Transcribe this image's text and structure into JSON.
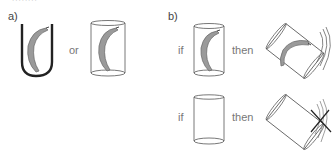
{
  "header_fragment": "........",
  "panel_a": {
    "label": "a)",
    "connector": "or",
    "items": [
      {
        "name": "banana-in-u-tube",
        "description": "banana held in open U-shaped holder"
      },
      {
        "name": "banana-in-closed-cylinder",
        "description": "banana enclosed in cylinder"
      }
    ]
  },
  "panel_b": {
    "label": "b)",
    "rows": [
      {
        "if_label": "if",
        "then_label": "then",
        "condition": "cylinder containing banana",
        "result": "tilted cylinder with banana, motion lines"
      },
      {
        "if_label": "if",
        "then_label": "then",
        "condition": "empty cylinder",
        "result": "tilted empty cylinder, motion lines crossed out"
      }
    ]
  },
  "colors": {
    "outline": "#555555",
    "u_tube": "#222222",
    "banana_fill": "#9a9a9a",
    "banana_stroke": "#666666",
    "text": "#666666"
  }
}
